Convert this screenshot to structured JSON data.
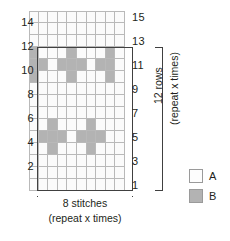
{
  "chart": {
    "columns": 10,
    "rows": 15,
    "colors": {
      "A": "#fbfbfb",
      "B": "#b3b3b3",
      "grid_line": "#b9b9b9",
      "outline": "#404040"
    },
    "row_labels_left": [
      "14",
      "12",
      "10",
      "8",
      "6",
      "4",
      "2"
    ],
    "row_labels_right": [
      "15",
      "13",
      "11",
      "9",
      "7",
      "5",
      "3",
      "1"
    ],
    "grid": [
      {
        "row": 15,
        "cells": [
          "A",
          "A",
          "A",
          "A",
          "A",
          "A",
          "A",
          "A",
          "A",
          "A"
        ]
      },
      {
        "row": 14,
        "cells": [
          "A",
          "A",
          "A",
          "A",
          "A",
          "A",
          "A",
          "A",
          "A",
          "A"
        ]
      },
      {
        "row": 13,
        "cells": [
          "A",
          "A",
          "A",
          "A",
          "A",
          "A",
          "A",
          "A",
          "A",
          "A"
        ]
      },
      {
        "row": 12,
        "cells": [
          "B",
          "A",
          "A",
          "A",
          "B",
          "A",
          "A",
          "A",
          "B",
          "A"
        ]
      },
      {
        "row": 11,
        "cells": [
          "B",
          "B",
          "A",
          "B",
          "B",
          "B",
          "A",
          "B",
          "B",
          "A"
        ]
      },
      {
        "row": 10,
        "cells": [
          "B",
          "A",
          "A",
          "A",
          "B",
          "A",
          "A",
          "A",
          "B",
          "A"
        ]
      },
      {
        "row": 9,
        "cells": [
          "A",
          "A",
          "A",
          "A",
          "A",
          "A",
          "A",
          "A",
          "A",
          "A"
        ]
      },
      {
        "row": 8,
        "cells": [
          "A",
          "A",
          "A",
          "A",
          "A",
          "A",
          "A",
          "A",
          "A",
          "A"
        ]
      },
      {
        "row": 7,
        "cells": [
          "A",
          "A",
          "A",
          "A",
          "A",
          "A",
          "A",
          "A",
          "A",
          "A"
        ]
      },
      {
        "row": 6,
        "cells": [
          "A",
          "A",
          "B",
          "A",
          "A",
          "A",
          "B",
          "A",
          "A",
          "A"
        ]
      },
      {
        "row": 5,
        "cells": [
          "A",
          "B",
          "B",
          "B",
          "A",
          "B",
          "B",
          "B",
          "A",
          "A"
        ]
      },
      {
        "row": 4,
        "cells": [
          "A",
          "A",
          "B",
          "A",
          "A",
          "A",
          "B",
          "A",
          "A",
          "A"
        ]
      },
      {
        "row": 3,
        "cells": [
          "A",
          "A",
          "A",
          "A",
          "A",
          "A",
          "A",
          "A",
          "A",
          "A"
        ]
      },
      {
        "row": 2,
        "cells": [
          "A",
          "A",
          "A",
          "A",
          "A",
          "A",
          "A",
          "A",
          "A",
          "A"
        ]
      },
      {
        "row": 1,
        "cells": [
          "A",
          "A",
          "A",
          "A",
          "A",
          "A",
          "A",
          "A",
          "A",
          "A"
        ]
      }
    ]
  },
  "annotations": {
    "rows_bracket_label": "12 rows",
    "rows_repeat_label": "(repeat x times)",
    "stitches_label": "8 stitches",
    "stitches_repeat_label": "(repeat x times)"
  },
  "legend": {
    "items": [
      {
        "key": "A",
        "label": "A",
        "color": "#fdfdfd"
      },
      {
        "key": "B",
        "label": "B",
        "color": "#b3b3b3"
      }
    ]
  }
}
